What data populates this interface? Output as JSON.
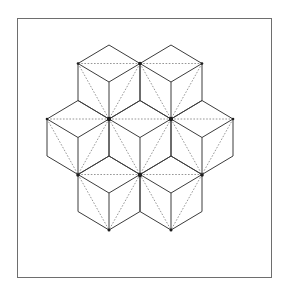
{
  "figure": {
    "frame": {
      "left": 17,
      "top": 18,
      "right": 272,
      "bottom": 278
    },
    "geometry": {
      "half_width": 31,
      "half_height": 18.5
    },
    "cube_centers": [
      [
        109,
        82
      ],
      [
        171,
        82
      ],
      [
        78,
        137.5
      ],
      [
        140,
        137.5
      ],
      [
        202,
        137.5
      ],
      [
        109,
        193
      ],
      [
        171,
        193
      ]
    ],
    "vertex_dots": [
      {
        "x": 78,
        "y": 63.5,
        "r": 1.3
      },
      {
        "x": 140,
        "y": 63.5,
        "r": 1.8
      },
      {
        "x": 202,
        "y": 63.5,
        "r": 1.3
      },
      {
        "x": 47,
        "y": 119,
        "r": 1.3
      },
      {
        "x": 109,
        "y": 119,
        "r": 2.2
      },
      {
        "x": 171,
        "y": 119,
        "r": 2.2
      },
      {
        "x": 233,
        "y": 119,
        "r": 1.3
      },
      {
        "x": 78,
        "y": 175,
        "r": 1.8
      },
      {
        "x": 140,
        "y": 175,
        "r": 2.2
      },
      {
        "x": 202,
        "y": 175,
        "r": 1.8
      },
      {
        "x": 109,
        "y": 230,
        "r": 1.5
      },
      {
        "x": 171,
        "y": 230,
        "r": 1.5
      }
    ],
    "colors": {
      "solid_edge": "#3c3c3c",
      "dotted_edge": "#8a8a8a",
      "frame": "#6e6e6e",
      "dot": "#1e1e1e",
      "background": "#ffffff"
    }
  }
}
